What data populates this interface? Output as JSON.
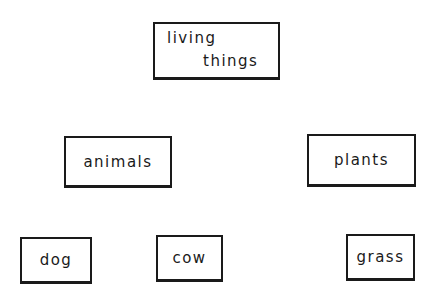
{
  "diagram": {
    "type": "hierarchy",
    "nodes": {
      "root": {
        "line1": "living",
        "line2": "things"
      },
      "animals": {
        "label": "animals"
      },
      "plants": {
        "label": "plants"
      },
      "dog": {
        "label": "dog"
      },
      "cow": {
        "label": "cow"
      },
      "grass": {
        "label": "grass"
      }
    },
    "levels": [
      [
        "living things"
      ],
      [
        "animals",
        "plants"
      ],
      [
        "dog",
        "cow",
        "grass"
      ]
    ]
  }
}
